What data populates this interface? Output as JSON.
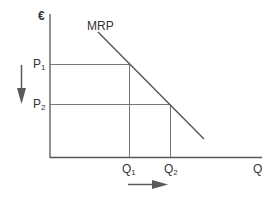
{
  "diagram": {
    "title": "",
    "y_axis_label": "€",
    "x_axis_label": "Q",
    "curve_label": "MRP",
    "price_levels": [
      {
        "label": "P",
        "sub": "1"
      },
      {
        "label": "P",
        "sub": "2"
      }
    ],
    "quantity_levels": [
      {
        "label": "Q",
        "sub": "1"
      },
      {
        "label": "Q",
        "sub": "2"
      }
    ],
    "arrows": [
      {
        "name": "price-decrease-arrow",
        "direction": "down"
      },
      {
        "name": "quantity-increase-arrow",
        "direction": "right"
      }
    ],
    "colors": {
      "axis": "#555555",
      "curve": "#555555",
      "guides": "#777777",
      "arrow": "#5a5a5a",
      "text": "#333333"
    }
  }
}
